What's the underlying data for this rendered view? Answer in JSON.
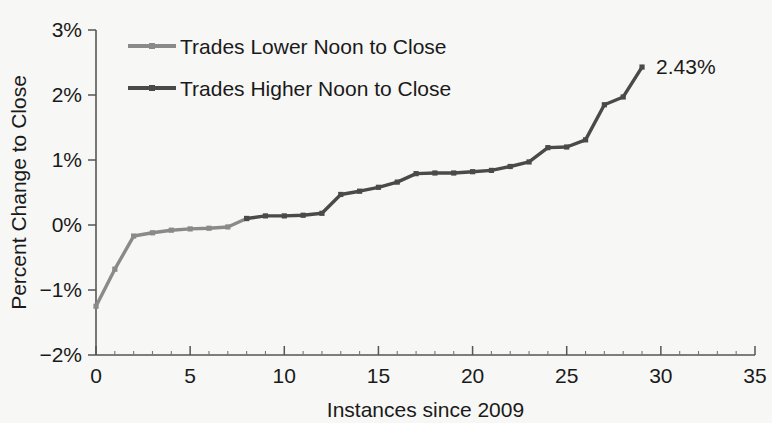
{
  "chart_data": {
    "type": "line",
    "title": "",
    "xlabel": "Instances since 2009",
    "ylabel": "Percent Change to Close",
    "xlim": [
      0,
      35
    ],
    "ylim": [
      -2,
      3
    ],
    "xticks": [
      0,
      5,
      10,
      15,
      20,
      25,
      30,
      35
    ],
    "xticklabels": [
      "0",
      "5",
      "10",
      "15",
      "20",
      "25",
      "30",
      "35"
    ],
    "yticks": [
      -2,
      -1,
      0,
      1,
      2,
      3
    ],
    "yticklabels": [
      "−2%",
      "−1%",
      "0%",
      "1%",
      "2%",
      "3%"
    ],
    "grid": false,
    "legend_position": "upper-left",
    "x": [
      0,
      1,
      2,
      3,
      4,
      5,
      6,
      7,
      8,
      9,
      10,
      11,
      12,
      13,
      14,
      15,
      16,
      17,
      18,
      19,
      20,
      21,
      22,
      23,
      24,
      25,
      26,
      27,
      28,
      29
    ],
    "series": [
      {
        "name": "Trades Lower Noon to Close",
        "color": "#8a8a8a",
        "values": [
          -1.25,
          -0.68,
          -0.17,
          -0.12,
          -0.08,
          -0.06,
          -0.05,
          -0.03,
          0.1,
          null,
          null,
          null,
          null,
          null,
          null,
          null,
          null,
          null,
          null,
          null,
          null,
          null,
          null,
          null,
          null,
          null,
          null,
          null,
          null,
          null
        ]
      },
      {
        "name": "Trades Higher Noon to Close",
        "color": "#4a4a4a",
        "values": [
          null,
          null,
          null,
          null,
          null,
          null,
          null,
          null,
          0.1,
          0.14,
          0.14,
          0.15,
          0.18,
          0.47,
          0.52,
          0.58,
          0.66,
          0.79,
          0.8,
          0.8,
          0.82,
          0.84,
          0.9,
          0.97,
          1.19,
          1.2,
          1.31,
          1.85,
          1.97,
          2.43
        ]
      }
    ],
    "annotations": [
      {
        "text": "2.43%",
        "x": 29,
        "y": 2.43,
        "name": "final-value-label"
      }
    ]
  },
  "legend": {
    "items": [
      {
        "label": "Trades Lower Noon to Close",
        "color": "#8a8a8a"
      },
      {
        "label": "Trades Higher Noon to Close",
        "color": "#4a4a4a"
      }
    ]
  }
}
